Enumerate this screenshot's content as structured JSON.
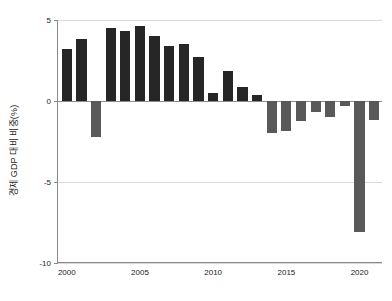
{
  "chart_data": {
    "type": "bar",
    "title": "",
    "subtitle": "",
    "xlabel": "",
    "ylabel": "경제 GDP 대비 비중(%)",
    "categories": [
      2000,
      2001,
      2002,
      2003,
      2004,
      2005,
      2006,
      2007,
      2008,
      2009,
      2010,
      2011,
      2012,
      2013,
      2014,
      2015,
      2016,
      2017,
      2018,
      2019,
      2020,
      2021
    ],
    "values": [
      3.2,
      3.8,
      -2.2,
      4.5,
      4.35,
      4.6,
      4.0,
      3.4,
      3.5,
      2.7,
      0.5,
      1.85,
      0.85,
      0.35,
      -2.0,
      -1.85,
      -1.25,
      -0.7,
      -1.0,
      -0.3,
      -8.1,
      -1.2
    ],
    "series": [
      {
        "name": "경제 GDP 대비 비중(%)",
        "values": [
          3.2,
          3.8,
          -2.2,
          4.5,
          4.35,
          4.6,
          4.0,
          3.4,
          3.5,
          2.7,
          0.5,
          1.85,
          0.85,
          0.35,
          -2.0,
          -1.85,
          -1.25,
          -0.7,
          -1.0,
          -0.3,
          -8.1,
          -1.2
        ]
      }
    ],
    "ylim": [
      -10,
      5
    ],
    "xlim": [
      1999.4,
      2021.6
    ],
    "yticks": [
      5,
      0,
      -5,
      -10
    ],
    "ytick_labels": [
      "5",
      "0",
      "-5",
      "-10"
    ],
    "xticks": [
      2000,
      2005,
      2010,
      2015,
      2020
    ],
    "xtick_labels": [
      "2000",
      "2005",
      "2010",
      "2015",
      "2020"
    ],
    "grid": true,
    "grid_axis": "y",
    "legend": false,
    "legend_position": "none",
    "colors": {
      "positive_bar": "#262626",
      "negative_bar": "#595959",
      "gridline": "#d9d9d9",
      "zero_line": "#8a8a8a",
      "axis": "#8a8a8a",
      "text": "#1a1a1a",
      "background": "#ffffff"
    },
    "bar_width_ratio": 0.7
  }
}
